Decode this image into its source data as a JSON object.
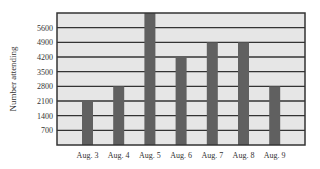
{
  "chart_data": {
    "type": "bar",
    "title": "",
    "xlabel": "",
    "ylabel": "Number attending",
    "categories": [
      "Aug. 3",
      "Aug. 4",
      "Aug. 5",
      "Aug. 6",
      "Aug. 7",
      "Aug. 8",
      "Aug. 9"
    ],
    "values": [
      2100,
      2800,
      6300,
      4200,
      4900,
      4900,
      2800
    ],
    "yticks": [
      700,
      1400,
      2100,
      2800,
      3500,
      4200,
      4900,
      5600
    ],
    "ylim": [
      0,
      6300
    ],
    "grid": true,
    "legend": null
  },
  "colors": {
    "plot_background": "#e6e6e6",
    "bar": "#606060",
    "gridline": "#333333",
    "frame": "#333333"
  }
}
